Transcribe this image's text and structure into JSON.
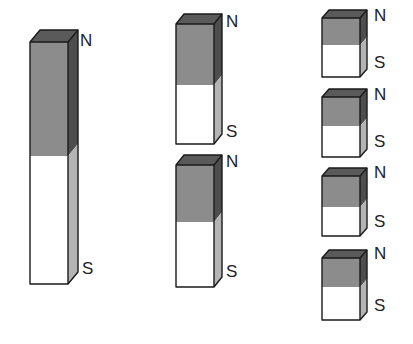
{
  "colors": {
    "north_front": "#8c8c8c",
    "north_side": "#4e4e4e",
    "top": "#5a5a5a",
    "south_front": "#ffffff",
    "south_side": "#b4b4b4",
    "outline": "#1a1a1a"
  },
  "labels": {
    "north": "N",
    "south": "S"
  },
  "groups": [
    {
      "name": "whole-magnet",
      "magnets": [
        {
          "x": 30,
          "y_top": 42,
          "w": 38,
          "split": 156,
          "bottom": 284,
          "depth_x": 10,
          "depth_y": 12,
          "n_label": {
            "x": 80,
            "y": 46
          },
          "s_label": {
            "x": 82,
            "y": 274
          }
        }
      ]
    },
    {
      "name": "halves",
      "magnets": [
        {
          "x": 176,
          "y_top": 24,
          "w": 38,
          "split": 85,
          "bottom": 144,
          "depth_x": 8,
          "depth_y": 10,
          "n_label": {
            "x": 226,
            "y": 27
          },
          "s_label": {
            "x": 226,
            "y": 137
          }
        },
        {
          "x": 176,
          "y_top": 165,
          "w": 38,
          "split": 222,
          "bottom": 287,
          "depth_x": 8,
          "depth_y": 10,
          "n_label": {
            "x": 226,
            "y": 167
          },
          "s_label": {
            "x": 226,
            "y": 277
          }
        }
      ]
    },
    {
      "name": "quarters",
      "magnets": [
        {
          "x": 322,
          "y_top": 18,
          "w": 38,
          "split": 45,
          "bottom": 77,
          "depth_x": 7,
          "depth_y": 8,
          "n_label": {
            "x": 374,
            "y": 21
          },
          "s_label": {
            "x": 374,
            "y": 68
          }
        },
        {
          "x": 322,
          "y_top": 97,
          "w": 38,
          "split": 126,
          "bottom": 157,
          "depth_x": 7,
          "depth_y": 8,
          "n_label": {
            "x": 374,
            "y": 100
          },
          "s_label": {
            "x": 374,
            "y": 147
          }
        },
        {
          "x": 322,
          "y_top": 176,
          "w": 38,
          "split": 207,
          "bottom": 236,
          "depth_x": 7,
          "depth_y": 8,
          "n_label": {
            "x": 374,
            "y": 178
          },
          "s_label": {
            "x": 374,
            "y": 227
          }
        },
        {
          "x": 322,
          "y_top": 258,
          "w": 38,
          "split": 287,
          "bottom": 320,
          "depth_x": 7,
          "depth_y": 8,
          "n_label": {
            "x": 374,
            "y": 259
          },
          "s_label": {
            "x": 374,
            "y": 311
          }
        }
      ]
    }
  ]
}
